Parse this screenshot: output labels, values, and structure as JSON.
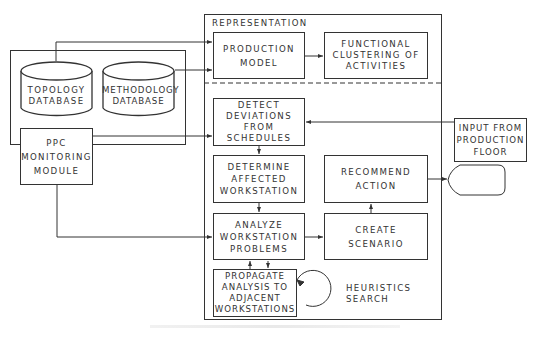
{
  "diagram": {
    "type": "flowchart",
    "left_group": {
      "topology_db": "TOPOLOGY\nDATABASE",
      "methodology_db": "METHODOLOGY\nDATABASE",
      "ppc_module": "PPC\nMONITORING\nMODULE"
    },
    "representation": {
      "title": "REPRESENTATION",
      "production_model": "PRODUCTION\nMODEL",
      "functional_clustering": "FUNCTIONAL\nCLUSTERING OF\nACTIVITIES"
    },
    "process": {
      "detect": "DETECT\nDEVIATIONS\nFROM\nSCHEDULES",
      "determine": "DETERMINE\nAFFECTED\nWORKSTATION",
      "analyze": "ANALYZE\nWORKSTATION\nPROBLEMS",
      "propagate": "PROPAGATE\nANALYSIS TO\nADJACENT\nWORKSTATIONS",
      "recommend": "RECOMMEND\nACTION",
      "scenario": "CREATE\nSCENARIO",
      "heuristics": "HEURISTICS\nSEARCH"
    },
    "external": {
      "input_floor": "INPUT FROM\nPRODUCTION\nFLOOR"
    },
    "colors": {
      "line": "#333333",
      "background": "#ffffff"
    }
  }
}
